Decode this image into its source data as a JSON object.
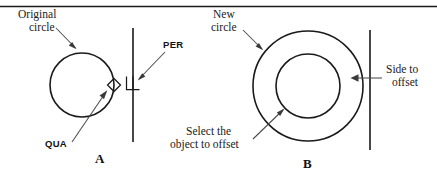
{
  "figure": {
    "top_rule": true,
    "background_color": "#ffffff",
    "line_color": "#1a1a1a",
    "leader_color": "#4a4a4a"
  },
  "panel_a": {
    "letter": "A",
    "labels": {
      "original_circle_line1": "Original",
      "original_circle_line2": "circle",
      "perpendicular_osnap": "PER",
      "quadrant_osnap": "QUA"
    },
    "geometry": {
      "circle": {
        "cx": 82,
        "cy": 85,
        "r": 32
      },
      "vertical_line": {
        "x": 133,
        "y1": 28,
        "y2": 142
      },
      "quadrant_marker": {
        "x": 114,
        "y": 85,
        "shape": "diamond"
      },
      "perpendicular_marker": {
        "x": 133,
        "y": 83,
        "shape": "perpendicular-square"
      }
    }
  },
  "panel_b": {
    "letter": "B",
    "labels": {
      "new_circle_line1": "New",
      "new_circle_line2": "circle",
      "select_object_line1": "Select the",
      "select_object_line2": "object to offset",
      "side_to_offset_line1": "Side to",
      "side_to_offset_line2": "offset"
    },
    "geometry": {
      "outer_circle": {
        "cx": 308,
        "cy": 86,
        "r": 55
      },
      "inner_circle": {
        "cx": 308,
        "cy": 86,
        "r": 32
      },
      "vertical_line": {
        "x": 370,
        "y1": 30,
        "y2": 150
      }
    }
  }
}
